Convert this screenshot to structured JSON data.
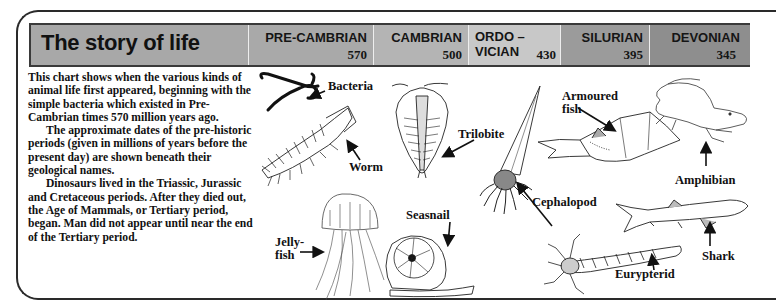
{
  "header": {
    "title": "The story of life",
    "periods": [
      {
        "name": "PRE-CAMBRIAN",
        "date": "570",
        "color": "#a9a9a9"
      },
      {
        "name": "CAMBRIAN",
        "date": "500",
        "color": "#b4b4b4"
      },
      {
        "name_line1": "ORDO –",
        "name_line2": "VICIAN",
        "date": "430",
        "color": "#c8c8c8"
      },
      {
        "name": "SILURIAN",
        "date": "395",
        "color": "#9b9b9b"
      },
      {
        "name": "DEVONIAN",
        "date": "345",
        "color": "#8e8e8e"
      }
    ]
  },
  "intro": {
    "paragraphs": [
      "This chart shows when the various kinds of animal life first appeared, beginning with the simple bacteria which existed in Pre-Cambrian times 570 million years ago.",
      "The approximate dates of the pre-historic periods (given in millions of years before the present day) are shown beneath their geological names.",
      "Dinosaurs lived in the Triassic, Jurassic and Cretaceous periods. After they died out, the Age of Mammals, or Tertiary period, began. Man did not appear until near the end of the Tertiary period."
    ]
  },
  "organisms": [
    {
      "label": "Bacteria",
      "icon": "bacteria-icon"
    },
    {
      "label": "Worm",
      "icon": "worm-icon"
    },
    {
      "label": "Trilobite",
      "icon": "trilobite-icon"
    },
    {
      "label": "Jelly-\nfish",
      "label_line1": "Jelly-",
      "label_line2": "fish",
      "icon": "jellyfish-icon"
    },
    {
      "label": "Seasnail",
      "icon": "seasnail-icon"
    },
    {
      "label": "Cephalopod",
      "icon": "cephalopod-icon"
    },
    {
      "label_line1": "Armoured",
      "label_line2": "fish",
      "icon": "armoured-fish-icon"
    },
    {
      "label": "Eurypterid",
      "icon": "eurypterid-icon"
    },
    {
      "label": "Amphibian",
      "icon": "amphibian-icon"
    },
    {
      "label": "Shark",
      "icon": "shark-icon"
    }
  ]
}
